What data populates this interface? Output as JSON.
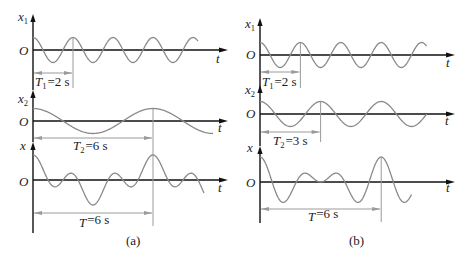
{
  "figure": {
    "panels": [
      {
        "caption": "(a)",
        "plots": [
          {
            "key": "x1",
            "y_label": {
              "var": "x",
              "sub": "1"
            },
            "origin_label": "O",
            "x_label": "t",
            "component_periods_s": [
              2
            ],
            "relative_amplitudes": [
              1
            ],
            "t_range_s": [
              0,
              8.25
            ],
            "period_marker": {
              "var": "T",
              "sub": "1",
              "value_text": "=2 s",
              "period_s": 2
            }
          },
          {
            "key": "x2",
            "y_label": {
              "var": "x",
              "sub": "2"
            },
            "origin_label": "O",
            "x_label": "t",
            "component_periods_s": [
              6
            ],
            "relative_amplitudes": [
              1
            ],
            "t_range_s": [
              0,
              9.0
            ],
            "period_marker": {
              "var": "T",
              "sub": "2",
              "value_text": "=6 s",
              "period_s": 6
            }
          },
          {
            "key": "x",
            "y_label": {
              "var": "x",
              "sub": ""
            },
            "origin_label": "O",
            "x_label": "t",
            "component_periods_s": [
              2,
              6
            ],
            "relative_amplitudes": [
              1,
              1
            ],
            "t_range_s": [
              0,
              8.55
            ],
            "period_marker": {
              "var": "T",
              "sub": "",
              "value_text": "=6 s",
              "period_s": 6
            }
          }
        ]
      },
      {
        "caption": "(b)",
        "plots": [
          {
            "key": "x1",
            "y_label": {
              "var": "x",
              "sub": "1"
            },
            "origin_label": "O",
            "x_label": "t",
            "component_periods_s": [
              2
            ],
            "relative_amplitudes": [
              1
            ],
            "t_range_s": [
              0,
              8.25
            ],
            "period_marker": {
              "var": "T",
              "sub": "1",
              "value_text": "=2 s",
              "period_s": 2
            }
          },
          {
            "key": "x2",
            "y_label": {
              "var": "x",
              "sub": "2"
            },
            "origin_label": "O",
            "x_label": "t",
            "component_periods_s": [
              3
            ],
            "relative_amplitudes": [
              1
            ],
            "t_range_s": [
              0,
              8.25
            ],
            "period_marker": {
              "var": "T",
              "sub": "2",
              "value_text": "=3 s",
              "period_s": 3
            }
          },
          {
            "key": "x",
            "y_label": {
              "var": "x",
              "sub": ""
            },
            "origin_label": "O",
            "x_label": "t",
            "component_periods_s": [
              2,
              3
            ],
            "relative_amplitudes": [
              1,
              1
            ],
            "t_range_s": [
              0,
              7.5
            ],
            "period_marker": {
              "var": "T",
              "sub": "",
              "value_text": "=6 s",
              "period_s": 6
            }
          }
        ]
      }
    ]
  },
  "colors": {
    "axis": "#111111",
    "curve": "#8a8a8a",
    "period_marker": "#9a9a9a",
    "text": "#1c1c1c",
    "background": "#ffffff"
  }
}
